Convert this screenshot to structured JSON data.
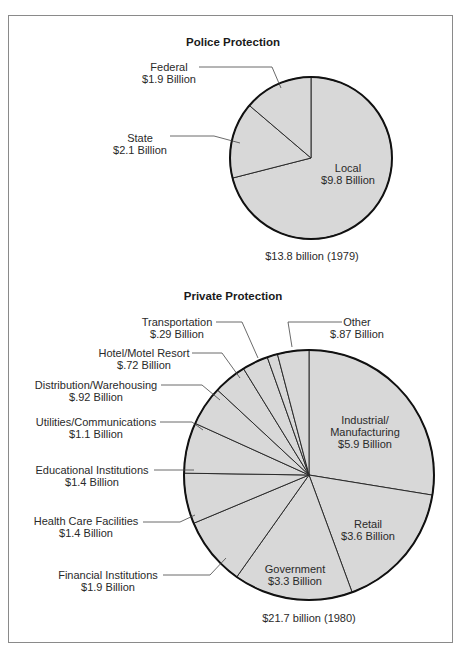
{
  "chart_data": [
    {
      "type": "pie",
      "title": "Police Protection",
      "total_label": "$13.8 billion (1979)",
      "unit": "Billion USD",
      "center": [
        311,
        158
      ],
      "radius": 81,
      "slices": [
        {
          "name": "Local",
          "value": 9.8,
          "label": "$9.8 Billion"
        },
        {
          "name": "State",
          "value": 2.1,
          "label": "$2.1 Billion"
        },
        {
          "name": "Federal",
          "value": 1.9,
          "label": "$1.9 Billion"
        }
      ]
    },
    {
      "type": "pie",
      "title": "Private Protection",
      "total_label": "$21.7 billion (1980)",
      "unit": "Billion USD",
      "center": [
        309,
        475
      ],
      "radius": 125,
      "slices": [
        {
          "name": "Industrial/ Manufacturing",
          "value": 5.9,
          "label": "$5.9 Billion"
        },
        {
          "name": "Retail",
          "value": 3.6,
          "label": "$3.6 Billion"
        },
        {
          "name": "Government",
          "value": 3.3,
          "label": "$3.3 Billion"
        },
        {
          "name": "Financial Institutions",
          "value": 1.9,
          "label": "$1.9 Billion"
        },
        {
          "name": "Health Care Facilities",
          "value": 1.4,
          "label": "$1.4 Billion"
        },
        {
          "name": "Educational Institutions",
          "value": 1.4,
          "label": "$1.4 Billion"
        },
        {
          "name": "Utilities/Communications",
          "value": 1.1,
          "label": "$1.1 Billion"
        },
        {
          "name": "Distribution/Warehousing",
          "value": 0.92,
          "label": "$.92 Billion"
        },
        {
          "name": "Hotel/Motel Resort",
          "value": 0.72,
          "label": "$.72 Billion"
        },
        {
          "name": "Transportation",
          "value": 0.29,
          "label": "$.29 Billion"
        },
        {
          "name": "Other",
          "value": 0.87,
          "label": "$.87 Billion"
        }
      ]
    }
  ],
  "police": {
    "title": "Police Protection",
    "total": "$13.8 billion (1979)",
    "local": {
      "name": "Local",
      "value": "$9.8 Billion"
    },
    "state": {
      "name": "State",
      "value": "$2.1 Billion"
    },
    "federal": {
      "name": "Federal",
      "value": "$1.9 Billion"
    }
  },
  "private": {
    "title": "Private Protection",
    "total": "$21.7 billion (1980)",
    "industrial": {
      "name1": "Industrial/",
      "name2": "Manufacturing",
      "value": "$5.9 Billion"
    },
    "retail": {
      "name": "Retail",
      "value": "$3.6 Billion"
    },
    "government": {
      "name": "Government",
      "value": "$3.3 Billion"
    },
    "financial": {
      "name": "Financial Institutions",
      "value": "$1.9 Billion"
    },
    "health": {
      "name": "Health Care Facilities",
      "value": "$1.4 Billion"
    },
    "educational": {
      "name": "Educational Institutions",
      "value": "$1.4 Billion"
    },
    "utilities": {
      "name": "Utilities/Communications",
      "value": "$1.1 Billion"
    },
    "distribution": {
      "name": "Distribution/Warehousing",
      "value": "$.92 Billion"
    },
    "hotel": {
      "name": "Hotel/Motel Resort",
      "value": "$.72 Billion"
    },
    "transportation": {
      "name": "Transportation",
      "value": "$.29 Billion"
    },
    "other": {
      "name": "Other",
      "value": "$.87 Billion"
    }
  }
}
